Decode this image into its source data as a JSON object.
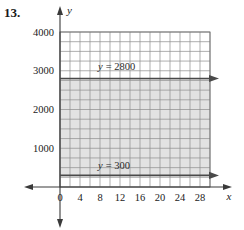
{
  "problem": {
    "number": "13."
  },
  "chart_data": {
    "type": "line",
    "title": "",
    "xlabel": "x",
    "ylabel": "y",
    "xlim": [
      0,
      30
    ],
    "ylim": [
      0,
      4000
    ],
    "grid": true,
    "x_tick_labels": [
      "0",
      "4",
      "8",
      "12",
      "16",
      "20",
      "24",
      "28"
    ],
    "x_tick_values": [
      0,
      4,
      8,
      12,
      16,
      20,
      24,
      28
    ],
    "y_tick_labels": [
      "1000",
      "2000",
      "3000",
      "4000"
    ],
    "y_tick_values": [
      1000,
      2000,
      3000,
      4000
    ],
    "x_grid_step": 2,
    "y_grid_step": 250,
    "series": [
      {
        "name": "y = 2800",
        "label": "y = 2800",
        "label_y_part": "y",
        "label_rest": "= 2800",
        "type": "horizontal-line",
        "value": 2800,
        "arrow": "right"
      },
      {
        "name": "y = 300",
        "label": "y = 300",
        "label_y_part": "y",
        "label_rest": "= 300",
        "type": "horizontal-line",
        "value": 300,
        "arrow": "right"
      }
    ],
    "shaded_region": {
      "name": "solution-region",
      "y_from": 300,
      "y_to": 2800,
      "x_from": 0,
      "x_to": 30,
      "color": "#e2e2e2"
    },
    "colors": {
      "grid": "#8c8c8c",
      "axis": "#3a3a3a",
      "line": "#4a4a4a",
      "shade": "#e2e2e2",
      "text": "#1a1a1a"
    }
  }
}
